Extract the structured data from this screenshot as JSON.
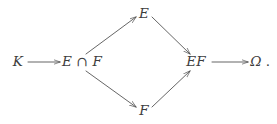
{
  "diagram": {
    "type": "commutative-diagram",
    "background_color": "#ffffff",
    "ink_color": "#3d3d3d",
    "nodes": [
      {
        "id": "K",
        "label": "K",
        "x": 18,
        "y": 62
      },
      {
        "id": "EcapF",
        "label": "E ∩ F",
        "x": 82,
        "y": 62
      },
      {
        "id": "E",
        "label": "E",
        "x": 144,
        "y": 14
      },
      {
        "id": "F",
        "label": "F",
        "x": 144,
        "y": 111
      },
      {
        "id": "EF",
        "label": "EF",
        "x": 196,
        "y": 62
      },
      {
        "id": "Omega",
        "label": "Ω",
        "x": 256,
        "y": 62
      }
    ],
    "trailing_punctuation": ".",
    "edges": [
      {
        "id": "K-to-EcapF",
        "from": "K",
        "to": "EcapF",
        "style": "solid",
        "arrow": "to",
        "orientation": "horizontal",
        "x1": 28,
        "y1": 62,
        "x2": 60,
        "y2": 62
      },
      {
        "id": "EcapF-to-E",
        "from": "EcapF",
        "to": "E",
        "style": "solid",
        "arrow": "to",
        "orientation": "diagonal-up",
        "x1": 86,
        "y1": 54,
        "x2": 136,
        "y2": 17
      },
      {
        "id": "EcapF-to-F",
        "from": "EcapF",
        "to": "F",
        "style": "solid",
        "arrow": "to",
        "orientation": "diagonal-down",
        "x1": 86,
        "y1": 72,
        "x2": 136,
        "y2": 107
      },
      {
        "id": "E-to-EF",
        "from": "E",
        "to": "EF",
        "style": "solid",
        "arrow": "to",
        "orientation": "diagonal-down",
        "x1": 152,
        "y1": 17,
        "x2": 190,
        "y2": 54
      },
      {
        "id": "F-to-EF",
        "from": "F",
        "to": "EF",
        "style": "solid",
        "arrow": "to",
        "orientation": "diagonal-up",
        "x1": 152,
        "y1": 107,
        "x2": 190,
        "y2": 72
      },
      {
        "id": "EF-to-Omega",
        "from": "EF",
        "to": "Omega",
        "style": "solid",
        "arrow": "to",
        "orientation": "horizontal",
        "x1": 212,
        "y1": 62,
        "x2": 248,
        "y2": 62
      }
    ]
  }
}
